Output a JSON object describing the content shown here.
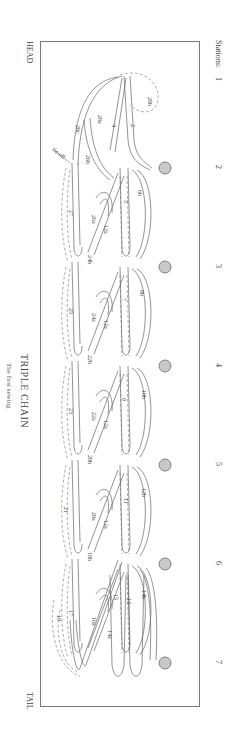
{
  "title": "TRIPLE CHAIN",
  "subtitle": "The first sewing",
  "ends": {
    "head": "HEAD",
    "tail": "TAIL"
  },
  "stations": {
    "label": "Stations:",
    "items": [
      {
        "num": "1",
        "y": 80
      },
      {
        "num": "2",
        "y": 168
      },
      {
        "num": "3",
        "y": 267
      },
      {
        "num": "4",
        "y": 366
      },
      {
        "num": "5",
        "y": 465
      },
      {
        "num": "6",
        "y": 564
      },
      {
        "num": "7",
        "y": 663
      }
    ]
  },
  "station_holes": [
    168,
    267,
    366,
    465,
    564,
    663
  ],
  "colors": {
    "hole_fill": "#c8c8c8",
    "hole_stroke": "#6a6a6a",
    "line": "#666666",
    "frame": "#7a7a7a"
  },
  "annotations": {
    "tie_off": "tie-off"
  },
  "step_labels": [
    {
      "t": "28b",
      "x": 148,
      "y": 97
    },
    {
      "t": "2",
      "x": 131,
      "y": 124
    },
    {
      "t": "4",
      "x": 112,
      "y": 124
    },
    {
      "t": "28a",
      "x": 98,
      "y": 115
    },
    {
      "t": "28c",
      "x": 76,
      "y": 125
    },
    {
      "t": "26b",
      "x": 86,
      "y": 155
    },
    {
      "t": "6b",
      "x": 138,
      "y": 190
    },
    {
      "t": "5",
      "x": 124,
      "y": 200
    },
    {
      "t": "27",
      "x": 69,
      "y": 210
    },
    {
      "t": "26a",
      "x": 92,
      "y": 215
    },
    {
      "t": "12a",
      "x": 104,
      "y": 225
    },
    {
      "t": "24b",
      "x": 88,
      "y": 255
    },
    {
      "t": "8b",
      "x": 140,
      "y": 290
    },
    {
      "t": "7",
      "x": 122,
      "y": 298
    },
    {
      "t": "25",
      "x": 69,
      "y": 308
    },
    {
      "t": "24a",
      "x": 92,
      "y": 313
    },
    {
      "t": "12a",
      "x": 104,
      "y": 320
    },
    {
      "t": "22b",
      "x": 88,
      "y": 355
    },
    {
      "t": "10b",
      "x": 142,
      "y": 390
    },
    {
      "t": "9",
      "x": 122,
      "y": 398
    },
    {
      "t": "23",
      "x": 69,
      "y": 408
    },
    {
      "t": "22a",
      "x": 92,
      "y": 412
    },
    {
      "t": "12a",
      "x": 104,
      "y": 420
    },
    {
      "t": "20b",
      "x": 88,
      "y": 455
    },
    {
      "t": "12b",
      "x": 142,
      "y": 488
    },
    {
      "t": "11",
      "x": 124,
      "y": 498
    },
    {
      "t": "21",
      "x": 64,
      "y": 507
    },
    {
      "t": "20a",
      "x": 92,
      "y": 512
    },
    {
      "t": "12a",
      "x": 104,
      "y": 520
    },
    {
      "t": "18b",
      "x": 88,
      "y": 552
    },
    {
      "t": "14b",
      "x": 142,
      "y": 590
    },
    {
      "t": "13",
      "x": 127,
      "y": 598
    },
    {
      "t": "15",
      "x": 114,
      "y": 594
    },
    {
      "t": "17",
      "x": 69,
      "y": 610
    },
    {
      "t": "19",
      "x": 57,
      "y": 615
    },
    {
      "t": "16a",
      "x": 92,
      "y": 617
    },
    {
      "t": "14a",
      "x": 108,
      "y": 630
    }
  ]
}
